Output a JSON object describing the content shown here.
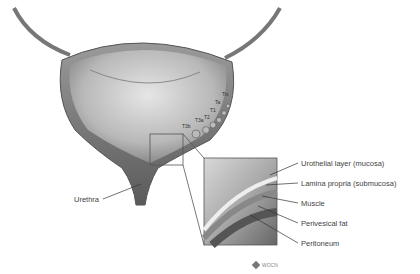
{
  "diagram": {
    "stages": [
      "Tis",
      "Ta",
      "T1",
      "T2",
      "T3a",
      "T3b"
    ],
    "labels": {
      "urethra": "Urethra",
      "urothelial": "Urothelial layer (mucosa)",
      "lamina": "Lamina propria (submucosa)",
      "muscle": "Muscle",
      "fat": "Perivesical fat",
      "peritoneum": "Peritoneum"
    },
    "logo": {
      "text": "WOCN"
    }
  }
}
